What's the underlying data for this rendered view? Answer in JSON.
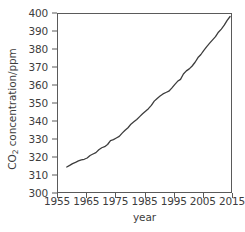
{
  "chart_data": {
    "type": "line",
    "title": "",
    "xlabel": "year",
    "ylabel": "CO2 concentration/ppm",
    "ylabel_parts": {
      "pre": "CO",
      "sub": "2",
      "post": " concentration/ppm"
    },
    "xlim": [
      1955,
      2015
    ],
    "ylim": [
      300,
      400
    ],
    "xticks": [
      1955,
      1965,
      1975,
      1985,
      1995,
      2005,
      2015
    ],
    "yticks": [
      300,
      310,
      320,
      330,
      340,
      350,
      360,
      370,
      380,
      390,
      400
    ],
    "grid": false,
    "legend": false,
    "line_color": "#3d3d3d",
    "line_width": 1.3,
    "series": [
      {
        "name": "CO2 concentration",
        "x": [
          1958,
          1959,
          1960,
          1961,
          1962,
          1963,
          1964,
          1965,
          1966,
          1967,
          1968,
          1969,
          1970,
          1971,
          1972,
          1973,
          1974,
          1975,
          1976,
          1977,
          1978,
          1979,
          1980,
          1981,
          1982,
          1983,
          1984,
          1985,
          1986,
          1987,
          1988,
          1989,
          1990,
          1991,
          1992,
          1993,
          1994,
          1995,
          1996,
          1997,
          1998,
          1999,
          2000,
          2001,
          2002,
          2003,
          2004,
          2005,
          2006,
          2007,
          2008,
          2009,
          2010,
          2011,
          2012,
          2013,
          2014
        ],
        "values": [
          315.0,
          315.9,
          316.9,
          317.6,
          318.4,
          318.9,
          319.3,
          320.0,
          321.4,
          322.2,
          323.0,
          324.6,
          325.7,
          326.3,
          327.5,
          329.7,
          330.2,
          331.1,
          332.0,
          333.8,
          335.4,
          336.8,
          338.8,
          340.1,
          341.4,
          343.0,
          344.6,
          346.0,
          347.4,
          349.2,
          351.6,
          353.1,
          354.4,
          355.6,
          356.4,
          357.1,
          358.8,
          360.8,
          362.6,
          363.7,
          366.7,
          368.4,
          369.5,
          371.1,
          373.2,
          375.8,
          377.5,
          379.8,
          381.9,
          383.8,
          385.6,
          387.4,
          389.9,
          391.6,
          393.8,
          396.5,
          398.6
        ]
      }
    ]
  }
}
